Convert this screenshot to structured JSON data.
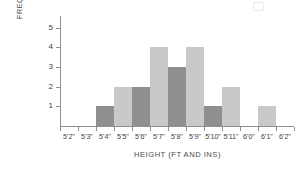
{
  "chart_data": {
    "type": "bar",
    "title": "",
    "xlabel": "HEIGHT (FT AND INS)",
    "ylabel": "FREQUENCY",
    "categories": [
      "5'2\"",
      "5'3\"",
      "5'4\"",
      "5'5\"",
      "5'6\"",
      "5'7\"",
      "5'8\"",
      "5'9\"",
      "5'10\"",
      "5'11\"",
      "6'0\"",
      "6'1\"",
      "6'2\""
    ],
    "values": [
      0,
      0,
      1,
      2,
      2,
      4,
      3,
      4,
      1,
      2,
      0,
      1,
      0
    ],
    "bar_colors": [
      "none",
      "none",
      "#8f8f8f",
      "#c9c9c9",
      "#8f8f8f",
      "#c9c9c9",
      "#8f8f8f",
      "#c9c9c9",
      "#8f8f8f",
      "#c9c9c9",
      "none",
      "#c9c9c9",
      "none"
    ],
    "ylim": [
      0,
      5.6
    ],
    "yticks": [
      1,
      2,
      3,
      4,
      5
    ],
    "ytick_labels": [
      "1",
      "2",
      "3",
      "4",
      "5"
    ],
    "grid": false,
    "legend": null
  },
  "colors": {
    "axis": "#8e8e8e",
    "text": "#3f3f3f",
    "bar_light": "#c9c9c9",
    "bar_dark": "#8f8f8f",
    "background": "#ffffff"
  }
}
